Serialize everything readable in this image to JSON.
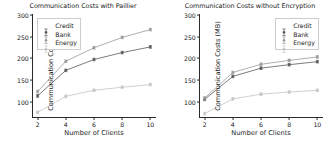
{
  "figure": {
    "width": 333,
    "height": 155,
    "background": "#ffffff"
  },
  "colors": {
    "credit": "#5a5a5a",
    "bank": "#9a9a9a",
    "energy": "#c4c4c4",
    "axis": "#2b2b2b",
    "text": "#1a1a1a",
    "legend_border": "#cccccc"
  },
  "chart_data": [
    {
      "type": "line",
      "id": "left",
      "title": "Communication Costs with Paillier",
      "xlabel": "Number of Clients",
      "ylabel": "Communication Costs (MB)",
      "x": [
        2,
        4,
        6,
        8,
        10
      ],
      "xticks": [
        2,
        4,
        6,
        8,
        10
      ],
      "xtick_labels": [
        "2",
        "4",
        "6",
        "8",
        "10"
      ],
      "yticks": [
        100,
        150,
        200,
        250,
        300
      ],
      "ytick_labels": [
        "100",
        "150",
        "200",
        "250",
        "300"
      ],
      "xlim": [
        1.6,
        10.4
      ],
      "ylim": [
        62,
        302
      ],
      "grid": false,
      "legend_position": "upper left",
      "errorbars": true,
      "series": [
        {
          "name": "Credit",
          "values": [
            113,
            172,
            197,
            213,
            226
          ],
          "errors": [
            3,
            3,
            3,
            3,
            3
          ]
        },
        {
          "name": "Bank",
          "values": [
            123,
            193,
            224,
            248,
            266
          ],
          "errors": [
            3,
            3,
            3,
            3,
            3
          ]
        },
        {
          "name": "Energy",
          "values": [
            75,
            112,
            126,
            133,
            139
          ],
          "errors": [
            3,
            3,
            3,
            3,
            3
          ]
        }
      ]
    },
    {
      "type": "line",
      "id": "right",
      "title": "Communication Costs without Encryption",
      "xlabel": "Number of Clients",
      "ylabel": "Communication Costs (MB)",
      "x": [
        2,
        4,
        6,
        8,
        10
      ],
      "xticks": [
        2,
        4,
        6,
        8,
        10
      ],
      "xtick_labels": [
        "2",
        "4",
        "6",
        "8",
        "10"
      ],
      "yticks": [
        100,
        150,
        200,
        250,
        300
      ],
      "ytick_labels": [
        "100",
        "150",
        "200",
        "250",
        "300"
      ],
      "xlim": [
        1.6,
        10.4
      ],
      "ylim": [
        62,
        302
      ],
      "grid": false,
      "legend_position": "upper right",
      "errorbars": true,
      "series": [
        {
          "name": "Credit",
          "values": [
            105,
            158,
            177,
            185,
            192
          ],
          "errors": [
            3,
            3,
            3,
            3,
            3
          ]
        },
        {
          "name": "Bank",
          "values": [
            108,
            167,
            186,
            195,
            203
          ],
          "errors": [
            3,
            3,
            3,
            3,
            3
          ]
        },
        {
          "name": "Energy",
          "values": [
            72,
            106,
            117,
            122,
            126
          ],
          "errors": [
            3,
            3,
            3,
            3,
            3
          ]
        }
      ]
    }
  ]
}
